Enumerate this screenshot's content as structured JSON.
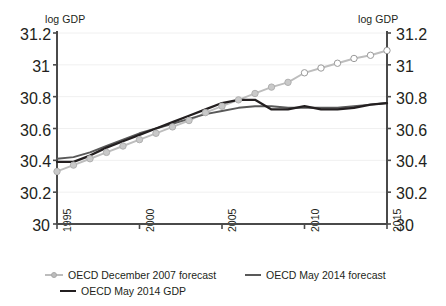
{
  "axes": {
    "left_title": "log GDP",
    "right_title": "log GDP",
    "y_ticks": [
      "31.2",
      "31",
      "30.8",
      "30.6",
      "30.4",
      "30.2",
      "30"
    ],
    "x_ticks": [
      "1995",
      "2000",
      "2005",
      "2010",
      "2015"
    ]
  },
  "legend": {
    "items": [
      {
        "label": "OECD December 2007 forecast",
        "marker": "line-with-circle-markers",
        "color": "#bdbdbd"
      },
      {
        "label": "OECD May 2014 forecast",
        "marker": "line",
        "color": "#595959"
      },
      {
        "label": "OECD May 2014 GDP",
        "marker": "line",
        "color": "#231f20"
      }
    ]
  },
  "chart_data": {
    "type": "line",
    "title": "",
    "xlabel": "",
    "ylabel": "log GDP",
    "xlim": [
      1995,
      2015
    ],
    "ylim": [
      30,
      31.2
    ],
    "ytick_values": [
      30,
      30.2,
      30.4,
      30.6,
      30.8,
      31,
      31.2
    ],
    "xtick_values": [
      1995,
      2000,
      2005,
      2010,
      2015
    ],
    "grid": "horizontal",
    "legend_position": "bottom-left",
    "dual_axis": true,
    "series": [
      {
        "name": "OECD December 2007 forecast",
        "color": "#bdbdbd",
        "marker": "circle",
        "x": [
          1995,
          1996,
          1997,
          1998,
          1999,
          2000,
          2001,
          2002,
          2003,
          2004,
          2005,
          2006,
          2007,
          2008,
          2009,
          2010,
          2011,
          2012,
          2013,
          2014,
          2015
        ],
        "values": [
          30.33,
          30.37,
          30.41,
          30.45,
          30.49,
          30.53,
          30.57,
          30.61,
          30.65,
          30.7,
          30.74,
          30.78,
          30.82,
          30.86,
          30.89,
          30.95,
          30.98,
          31.01,
          31.04,
          31.06,
          31.09
        ],
        "marker_fill": [
          "filled",
          "filled",
          "filled",
          "filled",
          "filled",
          "filled",
          "filled",
          "filled",
          "filled",
          "filled",
          "filled",
          "filled",
          "filled",
          "filled",
          "filled",
          "hollow",
          "hollow",
          "hollow",
          "hollow",
          "hollow",
          "hollow"
        ],
        "note": "Pre-crisis trend extrapolation; markers become hollow after 2009"
      },
      {
        "name": "OECD May 2014 forecast",
        "color": "#595959",
        "marker": "none",
        "x": [
          1995,
          1996,
          1997,
          1998,
          1999,
          2000,
          2001,
          2002,
          2003,
          2004,
          2005,
          2006,
          2007,
          2008,
          2009,
          2010,
          2011,
          2012,
          2013,
          2014,
          2015
        ],
        "values": [
          30.41,
          30.42,
          30.45,
          30.49,
          30.53,
          30.57,
          30.6,
          30.63,
          30.66,
          30.69,
          30.71,
          30.73,
          30.74,
          30.74,
          30.73,
          30.73,
          30.73,
          30.73,
          30.74,
          30.75,
          30.76
        ]
      },
      {
        "name": "OECD May 2014 GDP",
        "color": "#231f20",
        "marker": "none",
        "x": [
          1995,
          1996,
          1997,
          1998,
          1999,
          2000,
          2001,
          2002,
          2003,
          2004,
          2005,
          2006,
          2007,
          2008,
          2009,
          2010,
          2011,
          2012,
          2013,
          2014,
          2015
        ],
        "values": [
          30.39,
          30.39,
          30.43,
          30.48,
          30.52,
          30.56,
          30.6,
          30.64,
          30.68,
          30.72,
          30.76,
          30.78,
          30.78,
          30.72,
          30.72,
          30.74,
          30.72,
          30.72,
          30.73,
          30.75,
          30.76
        ]
      }
    ]
  }
}
